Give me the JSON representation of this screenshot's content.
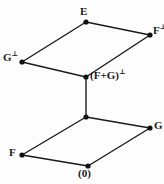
{
  "diagram": {
    "kind": "lattice-hasse-diagram",
    "background_color": "#fdfdfd",
    "line_color": "#1a1a1a",
    "node_color": "#111111",
    "nodes": [
      {
        "id": "E",
        "label": "E",
        "superscript": "",
        "x": 86,
        "y": 22,
        "label_x": 80,
        "label_y": 6,
        "label_align": "center"
      },
      {
        "id": "Fperp",
        "label": "F",
        "superscript": "⊥",
        "x": 150,
        "y": 35,
        "label_x": 153,
        "label_y": 25,
        "label_align": "left"
      },
      {
        "id": "Gperp",
        "label": "G",
        "superscript": "⊥",
        "x": 22,
        "y": 62,
        "label_x": 3,
        "label_y": 52,
        "label_align": "left"
      },
      {
        "id": "FGperp",
        "label": "(F+G)",
        "superscript": "⊥",
        "x": 86,
        "y": 77,
        "label_x": 90,
        "label_y": 70,
        "label_align": "left"
      },
      {
        "id": "FGmid",
        "label": "",
        "superscript": "",
        "x": 86,
        "y": 117,
        "label_x": 86,
        "label_y": 117,
        "label_align": "center"
      },
      {
        "id": "G",
        "label": "G",
        "superscript": "",
        "x": 150,
        "y": 128,
        "label_x": 154,
        "label_y": 120,
        "label_align": "left"
      },
      {
        "id": "F",
        "label": "F",
        "superscript": "",
        "x": 22,
        "y": 155,
        "label_x": 9,
        "label_y": 147,
        "label_align": "left"
      },
      {
        "id": "zero",
        "label": "(0)",
        "superscript": "",
        "x": 88,
        "y": 166,
        "label_x": 78,
        "label_y": 168,
        "label_align": "left"
      }
    ],
    "edges": [
      {
        "from": "Gperp",
        "to": "E",
        "name": "edge-gperp-e"
      },
      {
        "from": "E",
        "to": "Fperp",
        "name": "edge-e-fperp"
      },
      {
        "from": "Gperp",
        "to": "FGperp",
        "name": "edge-gperp-fgperp"
      },
      {
        "from": "FGperp",
        "to": "Fperp",
        "name": "edge-fgperp-fperp"
      },
      {
        "from": "FGperp",
        "to": "FGmid",
        "name": "edge-fgperp-fgmid"
      },
      {
        "from": "F",
        "to": "FGmid",
        "name": "edge-f-fgmid"
      },
      {
        "from": "FGmid",
        "to": "G",
        "name": "edge-fgmid-g"
      },
      {
        "from": "F",
        "to": "zero",
        "name": "edge-f-zero"
      },
      {
        "from": "zero",
        "to": "G",
        "name": "edge-zero-g"
      }
    ],
    "labels": {
      "E": "E",
      "F_perp": "F⊥",
      "G_perp": "G⊥",
      "FG_perp": "(F+G)⊥",
      "G": "G",
      "F": "F",
      "zero": "(0)"
    }
  }
}
